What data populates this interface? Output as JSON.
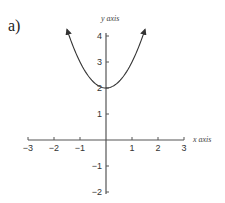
{
  "panel_label": "a)",
  "chart_data": {
    "type": "line",
    "title": "",
    "function": "y = x^2 + 2",
    "xlabel": "x axis",
    "ylabel": "y axis",
    "xlim": [
      -3,
      3
    ],
    "ylim": [
      -2,
      4
    ],
    "x_ticks": [
      -3,
      -2,
      -1,
      1,
      2,
      3
    ],
    "y_ticks": [
      4,
      3,
      2,
      1,
      -1,
      -2
    ],
    "x_tick_labels": [
      "−3",
      "−2",
      "−1",
      "1",
      "2",
      "3"
    ],
    "y_tick_labels": [
      "4",
      "3",
      "2",
      "1",
      "−1",
      "−2"
    ],
    "grid": false,
    "series": [
      {
        "name": "parabola",
        "x": [
          -1.5,
          -1.25,
          -1,
          -0.75,
          -0.5,
          -0.25,
          0,
          0.25,
          0.5,
          0.75,
          1,
          1.25,
          1.5
        ],
        "values": [
          4.25,
          3.5625,
          3,
          2.5625,
          2.25,
          2.0625,
          2,
          2.0625,
          2.25,
          2.5625,
          3,
          3.5625,
          4.25
        ],
        "arrows_at_ends": true
      }
    ],
    "colors": {
      "axis": "#555555",
      "curve": "#333333"
    }
  }
}
